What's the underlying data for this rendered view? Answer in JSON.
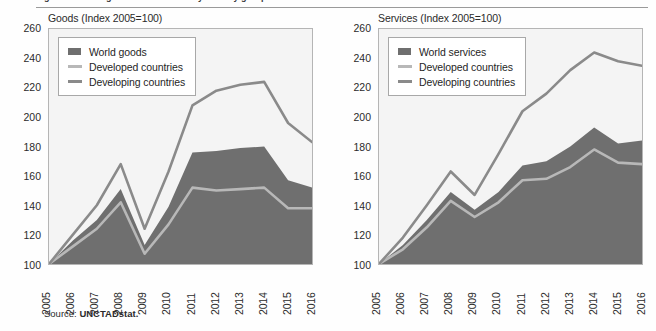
{
  "figure": {
    "truncated_top_text": "Figure: Trade in goods and services by country group",
    "source_lead": "Source:",
    "source_org": "UNCTADstat."
  },
  "colors": {
    "world_fill": "#6f6f6f",
    "developed_line": "#b8b8b8",
    "developing_line": "#8a8a8a",
    "plot_background": "#f4f4f4",
    "frame": "#b5b5b5",
    "text": "#2b2b2b"
  },
  "axis": {
    "y_ticks": [
      "260",
      "240",
      "220",
      "200",
      "180",
      "160",
      "140",
      "120",
      "100"
    ],
    "x_ticks": [
      "2005",
      "2006",
      "2007",
      "2008",
      "2009",
      "2010",
      "2011",
      "2012",
      "2013",
      "2014",
      "2015",
      "2016"
    ]
  },
  "panels": [
    {
      "id": "goods",
      "title": "Goods (Index 2005=100)",
      "legend": [
        {
          "label": "World goods",
          "key": "swatch",
          "color": "#6f6f6f"
        },
        {
          "label": "Developed countries",
          "key": "line",
          "color": "#b8b8b8"
        },
        {
          "label": "Developing countries",
          "key": "line",
          "color": "#8a8a8a"
        }
      ]
    },
    {
      "id": "services",
      "title": "Services (Index 2005=100)",
      "legend": [
        {
          "label": "World services",
          "key": "swatch",
          "color": "#6f6f6f"
        },
        {
          "label": "Developed countries",
          "key": "line",
          "color": "#b8b8b8"
        },
        {
          "label": "Developing countries",
          "key": "line",
          "color": "#8a8a8a"
        }
      ]
    }
  ],
  "chart_data": [
    {
      "type": "area",
      "id": "goods",
      "title": "Goods (Index 2005=100)",
      "xlabel": "",
      "ylabel": "Index 2005=100",
      "ylim": [
        100,
        260
      ],
      "xlim": [
        "2005",
        "2016"
      ],
      "grid": false,
      "legend_position": "top-left",
      "categories": [
        "2005",
        "2006",
        "2007",
        "2008",
        "2009",
        "2010",
        "2011",
        "2012",
        "2013",
        "2014",
        "2015",
        "2016"
      ],
      "series": [
        {
          "name": "World goods",
          "render": "area",
          "color": "#6f6f6f",
          "values": [
            100,
            116,
            130,
            151,
            113,
            139,
            176,
            177,
            179,
            180,
            157,
            152
          ]
        },
        {
          "name": "Developed countries",
          "render": "line",
          "color": "#b8b8b8",
          "values": [
            100,
            112,
            124,
            142,
            107,
            127,
            152,
            150,
            151,
            152,
            138,
            138
          ]
        },
        {
          "name": "Developing countries",
          "render": "line",
          "color": "#8a8a8a",
          "values": [
            100,
            120,
            140,
            168,
            124,
            163,
            208,
            218,
            222,
            224,
            196,
            183
          ]
        }
      ]
    },
    {
      "type": "area",
      "id": "services",
      "title": "Services (Index 2005=100)",
      "xlabel": "",
      "ylabel": "Index 2005=100",
      "ylim": [
        100,
        260
      ],
      "xlim": [
        "2005",
        "2016"
      ],
      "grid": false,
      "legend_position": "top-left",
      "categories": [
        "2005",
        "2006",
        "2007",
        "2008",
        "2009",
        "2010",
        "2011",
        "2012",
        "2013",
        "2014",
        "2015",
        "2016"
      ],
      "series": [
        {
          "name": "World services",
          "render": "area",
          "color": "#6f6f6f",
          "values": [
            100,
            113,
            130,
            149,
            137,
            149,
            167,
            170,
            180,
            193,
            182,
            184
          ]
        },
        {
          "name": "Developed countries",
          "render": "line",
          "color": "#b8b8b8",
          "values": [
            100,
            110,
            125,
            143,
            132,
            142,
            157,
            158,
            166,
            178,
            169,
            168
          ]
        },
        {
          "name": "Developing countries",
          "render": "line",
          "color": "#8a8a8a",
          "values": [
            100,
            118,
            140,
            163,
            147,
            175,
            204,
            216,
            232,
            244,
            238,
            235
          ]
        }
      ]
    }
  ]
}
